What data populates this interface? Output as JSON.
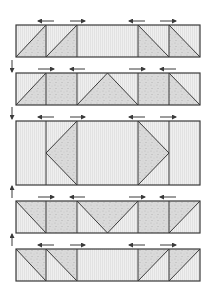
{
  "diagram": {
    "title": "",
    "colors": {
      "stroke": "#3a3a3a",
      "light_fill": "#ececec",
      "speckle_fill": "#d6d6d6",
      "speckle_dot": "#b8b8b8",
      "background": "#ffffff"
    },
    "columns_x": [
      16,
      46,
      77,
      138,
      169,
      200
    ],
    "rows": [
      {
        "id": "row-1",
        "top": 25,
        "bottom": 57,
        "arrows": [
          "left",
          "right",
          "left",
          "right"
        ],
        "cells": [
          {
            "col": 0,
            "type": "diag-up",
            "shaded": "lower-right"
          },
          {
            "col": 1,
            "type": "diag-up",
            "shaded": "lower-right"
          },
          {
            "col": 2,
            "type": "plain"
          },
          {
            "col": 3,
            "type": "diag-down",
            "shaded": "lower-left"
          },
          {
            "col": 4,
            "type": "diag-down",
            "shaded": "lower-left"
          }
        ]
      },
      {
        "id": "row-2",
        "top": 73,
        "bottom": 105,
        "arrows": [
          "right",
          "left",
          "right",
          "left"
        ],
        "cells": [
          {
            "col": 0,
            "type": "diag-up",
            "shaded": "lower-right"
          },
          {
            "col": 1,
            "type": "full"
          },
          {
            "col": 2,
            "type": "tri-up"
          },
          {
            "col": 3,
            "type": "full"
          },
          {
            "col": 4,
            "type": "diag-down",
            "shaded": "lower-left"
          }
        ]
      },
      {
        "id": "row-3",
        "top": 121,
        "bottom": 185,
        "arrows": [
          "left",
          "right",
          "left",
          "right"
        ],
        "cells": [
          {
            "col": 0,
            "type": "plain"
          },
          {
            "col": 1,
            "type": "tri-left"
          },
          {
            "col": 2,
            "type": "plain"
          },
          {
            "col": 3,
            "type": "tri-right"
          },
          {
            "col": 4,
            "type": "plain"
          }
        ]
      },
      {
        "id": "row-4",
        "top": 201,
        "bottom": 233,
        "arrows": [
          "right",
          "left",
          "right",
          "left"
        ],
        "cells": [
          {
            "col": 0,
            "type": "diag-down",
            "shaded": "upper-right"
          },
          {
            "col": 1,
            "type": "full"
          },
          {
            "col": 2,
            "type": "tri-down"
          },
          {
            "col": 3,
            "type": "full"
          },
          {
            "col": 4,
            "type": "diag-up",
            "shaded": "upper-left"
          }
        ]
      },
      {
        "id": "row-5",
        "top": 249,
        "bottom": 281,
        "arrows": [
          "left",
          "right",
          "left",
          "right"
        ],
        "cells": [
          {
            "col": 0,
            "type": "diag-down",
            "shaded": "upper-right"
          },
          {
            "col": 1,
            "type": "diag-down",
            "shaded": "upper-right"
          },
          {
            "col": 2,
            "type": "plain"
          },
          {
            "col": 3,
            "type": "diag-up",
            "shaded": "upper-left"
          },
          {
            "col": 4,
            "type": "diag-up",
            "shaded": "upper-left"
          }
        ]
      }
    ],
    "arrow_positions_x": [
      [
        38,
        54
      ],
      [
        70,
        85
      ],
      [
        129,
        145
      ],
      [
        160,
        176
      ]
    ],
    "side_arrows": [
      {
        "x": 12,
        "y1": 60,
        "y2": 72,
        "direction": "down"
      },
      {
        "x": 12,
        "y1": 107,
        "y2": 119,
        "direction": "down"
      },
      {
        "x": 12,
        "y1": 198,
        "y2": 186,
        "direction": "up"
      },
      {
        "x": 12,
        "y1": 246,
        "y2": 234,
        "direction": "up"
      }
    ]
  }
}
